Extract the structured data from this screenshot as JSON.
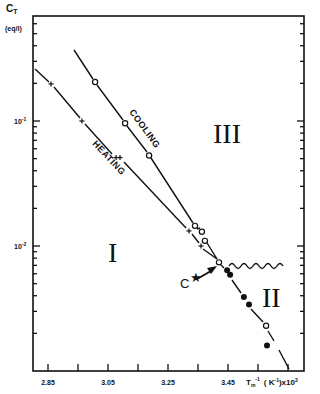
{
  "chart_data": {
    "type": "scatter",
    "title": "",
    "ylabel": "C_T (eq/l)",
    "ylabel_main": "C",
    "ylabel_sub": "T",
    "ylabel_units": "(eq/l)",
    "xlabel": "T_m^-1 (K^-1)x10^3",
    "xlabel_main": "T",
    "xlabel_sub": "m",
    "xlabel_sup": "-1",
    "xlabel_units_open": "( K",
    "xlabel_units_sup": "-1",
    "xlabel_units_close": ")x10",
    "xlabel_units_pow": "3",
    "yscale": "log",
    "ylim": [
      0.001,
      0.69
    ],
    "xlim": [
      2.8,
      3.7
    ],
    "x_ticks": [
      2.85,
      2.95,
      3.05,
      3.15,
      3.25,
      3.35,
      3.45,
      3.55,
      3.65
    ],
    "x_tick_labels": [
      "2.85",
      "",
      "3.05",
      "",
      "3.25",
      "",
      "3.45",
      "",
      ""
    ],
    "y_tick_labels": [
      {
        "base": "10",
        "exp": "-1",
        "value": 0.1
      },
      {
        "base": "10",
        "exp": "-2",
        "value": 0.01
      }
    ],
    "grid": false,
    "series": [
      {
        "name": "COOLING",
        "marker": "open-circle",
        "x": [
          3.007,
          3.107,
          3.187,
          3.34,
          3.363,
          3.373,
          3.42
        ],
        "y": [
          0.205,
          0.096,
          0.053,
          0.0145,
          0.013,
          0.011,
          0.0074
        ],
        "fit_line": {
          "x": [
            2.97,
            3.42
          ],
          "y": [
            0.38,
            0.0074
          ]
        }
      },
      {
        "name": "HEATING",
        "marker": "cross",
        "x": [
          2.86,
          2.963,
          3.077,
          3.09,
          3.32,
          3.36
        ],
        "y": [
          0.198,
          0.1,
          0.051,
          0.051,
          0.0132,
          0.01
        ],
        "fit_line": {
          "x": [
            2.8,
            3.42
          ],
          "y": [
            0.27,
            0.0074
          ]
        }
      },
      {
        "name": "Region II",
        "marker": "filled-circle",
        "x": [
          3.447,
          3.457,
          3.503,
          3.52,
          3.58
        ],
        "y": [
          0.0064,
          0.0059,
          0.0039,
          0.0034,
          0.0016
        ]
      },
      {
        "name": "Region II (open)",
        "marker": "open-circle",
        "x": [
          3.577
        ],
        "y": [
          0.0023
        ]
      }
    ],
    "annotations": [
      {
        "text": "I",
        "x": 3.1,
        "y": 0.0085,
        "meaning": "region I"
      },
      {
        "text": "II",
        "x": 3.6,
        "y": 0.0042,
        "meaning": "region II"
      },
      {
        "text": "III",
        "x": 3.35,
        "y": 0.1,
        "meaning": "region III"
      },
      {
        "text": "C",
        "x": 3.3,
        "y": 0.0055,
        "meaning": "point C★ arrow to intersection"
      },
      {
        "text": "wavy boundary line",
        "x": [
          3.45,
          3.65
        ],
        "y": 0.0074
      }
    ]
  }
}
